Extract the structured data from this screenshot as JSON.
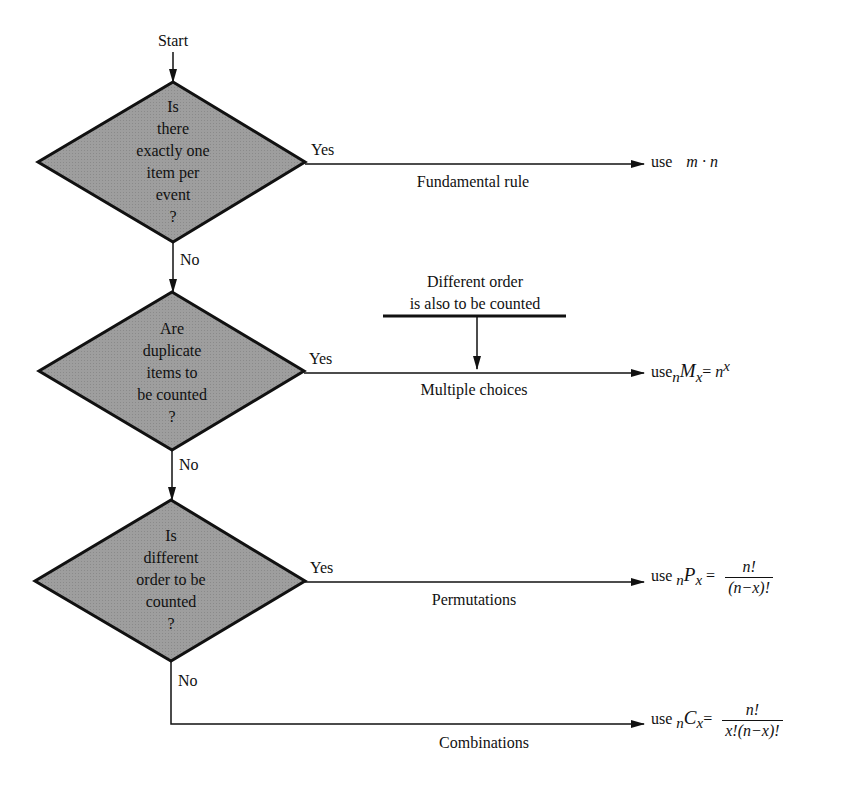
{
  "diagram": {
    "start_label": "Start",
    "colors": {
      "diamond_fill": "#9a9a9a",
      "stroke": "#111111",
      "background": "#ffffff"
    },
    "decisions": [
      {
        "lines": [
          "Is",
          "there",
          "exactly one",
          "item per",
          "event",
          "?"
        ],
        "yes_label": "Yes",
        "no_label": "No",
        "branch_label": "Fundamental rule",
        "result": {
          "prefix": "use",
          "formula": "m · n"
        }
      },
      {
        "lines": [
          "Are",
          "duplicate",
          "items to",
          "be counted",
          "?"
        ],
        "yes_label": "Yes",
        "no_label": "No",
        "branch_label": "Multiple choices",
        "note_line1": "Different order",
        "note_line2": "is also to be counted",
        "result": {
          "prefix": "use",
          "sub_left": "n",
          "symbol": "M",
          "sub_right": "x",
          "equals": "=",
          "rhs_base": "n",
          "rhs_exp": "x"
        }
      },
      {
        "lines": [
          "Is",
          "different",
          "order to be",
          "counted",
          "?"
        ],
        "yes_label": "Yes",
        "no_label": "No",
        "branch_label": "Permutations",
        "result": {
          "prefix": "use",
          "sub_left": "n",
          "symbol": "P",
          "sub_right": "x",
          "equals": "=",
          "numerator": "n!",
          "denominator": "(n−x)!"
        }
      }
    ],
    "final": {
      "branch_label": "Combinations",
      "result": {
        "prefix": "use",
        "sub_left": "n",
        "symbol": "C",
        "sub_right": "x",
        "equals": "=",
        "numerator": "n!",
        "denominator": "x!(n−x)!"
      }
    }
  }
}
